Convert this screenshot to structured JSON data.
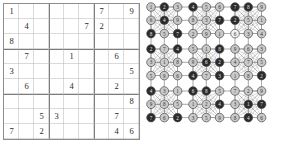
{
  "figure": {
    "caption": ""
  },
  "sudoku": {
    "title": "sudoku-puzzle-grid",
    "size": 9,
    "box_size": 3,
    "grid_line_color": "#7d7d7d",
    "cell_line_color": "#b6b6b6",
    "digit_color": "#2b2b2b",
    "rows": [
      [
        "1",
        "",
        "",
        "",
        "",
        "",
        "7",
        "",
        "9"
      ],
      [
        "",
        "4",
        "",
        "",
        "",
        "7",
        "2",
        "",
        ""
      ],
      [
        "8",
        "",
        "",
        "",
        "",
        "",
        "",
        "",
        ""
      ],
      [
        "",
        "7",
        "",
        "",
        "1",
        "",
        "",
        "6",
        ""
      ],
      [
        "3",
        "",
        "",
        "",
        "",
        "",
        "",
        "",
        "5"
      ],
      [
        "",
        "6",
        "",
        "",
        "4",
        "",
        "",
        "2",
        ""
      ],
      [
        "",
        "",
        "",
        "",
        "",
        "",
        "",
        "",
        "8"
      ],
      [
        "",
        "",
        "5",
        "3",
        "",
        "",
        "",
        "7",
        ""
      ],
      [
        "7",
        "",
        "2",
        "",
        "",
        "",
        "",
        "4",
        "6"
      ]
    ]
  },
  "graph": {
    "title": "sudoku-graph-coloring-diagram",
    "description": "9 by 9 lattice of vertices; each 3 by 3 block drawn as a dense clique of edges",
    "rows": 9,
    "cols": 9,
    "node_labels": [
      [
        "1",
        "2",
        "3",
        "4",
        "5",
        "6",
        "7",
        "8",
        "9"
      ],
      [
        "6",
        "4",
        "9",
        "8",
        "3",
        "7",
        "2",
        "5",
        "1"
      ],
      [
        "8",
        "5",
        "7",
        "2",
        "9",
        "1",
        "6",
        "3",
        "4"
      ],
      [
        "2",
        "7",
        "4",
        "5",
        "1",
        "8",
        "9",
        "6",
        "3"
      ],
      [
        "3",
        "1",
        "8",
        "9",
        "6",
        "2",
        "4",
        "7",
        "5"
      ],
      [
        "5",
        "9",
        "6",
        "4",
        "7",
        "3",
        "1",
        "8",
        "2"
      ],
      [
        "4",
        "3",
        "1",
        "6",
        "8",
        "5",
        "7",
        "2",
        "9"
      ],
      [
        "9",
        "8",
        "5",
        "1",
        "2",
        "4",
        "3",
        "1",
        "7"
      ],
      [
        "7",
        "6",
        "2",
        "3",
        "5",
        "9",
        "8",
        "4",
        "6"
      ]
    ],
    "node_shades": [
      [
        "light",
        "dark",
        "light",
        "dark",
        "light",
        "light",
        "dark",
        "dark",
        "light"
      ],
      [
        "light",
        "dark",
        "light",
        "light",
        "light",
        "dark",
        "dark",
        "light",
        "light"
      ],
      [
        "dark",
        "light",
        "dark",
        "light",
        "light",
        "light",
        "white",
        "light",
        "light"
      ],
      [
        "dark",
        "light",
        "dark",
        "light",
        "light",
        "dark",
        "light",
        "light",
        "light"
      ],
      [
        "light",
        "light",
        "light",
        "light",
        "dark",
        "dark",
        "light",
        "light",
        "light"
      ],
      [
        "light",
        "light",
        "light",
        "dark",
        "light",
        "dark",
        "light",
        "light",
        "dark"
      ],
      [
        "dark",
        "light",
        "light",
        "dark",
        "dark",
        "light",
        "light",
        "light",
        "light"
      ],
      [
        "light",
        "light",
        "light",
        "light",
        "light",
        "dark",
        "light",
        "dark",
        "dark"
      ],
      [
        "dark",
        "light",
        "dark",
        "light",
        "light",
        "light",
        "light",
        "dark",
        "light"
      ]
    ],
    "colors": {
      "node_light": "#c9c9c9",
      "node_dark": "#2b2b2b",
      "node_white": "#f2f2f2",
      "node_stroke": "#4a4a4a",
      "edge": "#8d8d8d",
      "label_on_light": "#333333",
      "label_on_dark": "#e8e8e8"
    }
  }
}
